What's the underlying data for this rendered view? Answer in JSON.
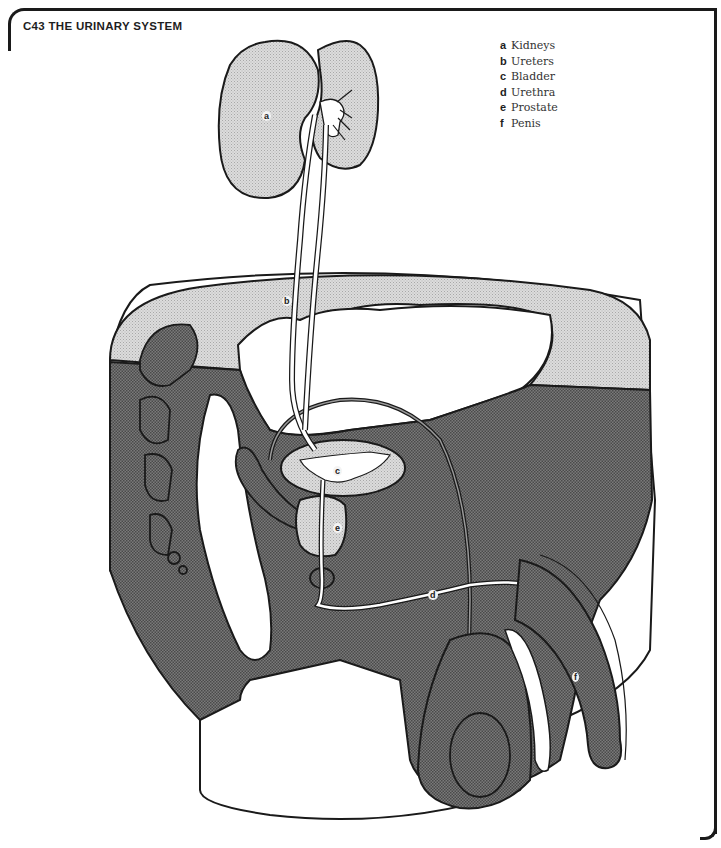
{
  "title": "C43  THE URINARY SYSTEM",
  "legend": [
    {
      "key": "a",
      "label": "Kidneys"
    },
    {
      "key": "b",
      "label": "Ureters"
    },
    {
      "key": "c",
      "label": "Bladder"
    },
    {
      "key": "d",
      "label": "Urethra"
    },
    {
      "key": "e",
      "label": "Prostate"
    },
    {
      "key": "f",
      "label": "Penis"
    }
  ],
  "labels": {
    "a": "a",
    "b": "b",
    "c": "c",
    "d": "d",
    "e": "e",
    "f": "f"
  },
  "colors": {
    "outline": "#1a1a1a",
    "dark_tissue": "#6b6b6b",
    "light_organ": "#cfcfcf",
    "paper": "#ffffff"
  }
}
